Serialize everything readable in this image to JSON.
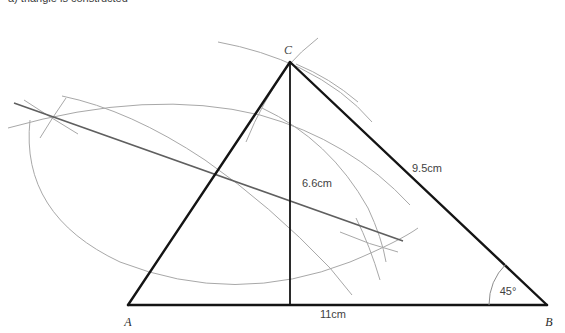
{
  "caption": {
    "text": "a) triangle is constructed"
  },
  "figure": {
    "colors": {
      "triangle_stroke": "#111111",
      "construction_arc": "#9a9a9a",
      "bisector_line": "#5a5a5a",
      "label_text": "#3f3f3f",
      "background": "#ffffff"
    },
    "vertices": [
      {
        "name": "A",
        "label": "A",
        "x": 128,
        "y": 305
      },
      {
        "name": "B",
        "label": "B",
        "x": 547,
        "y": 305
      },
      {
        "name": "C",
        "label": "C",
        "x": 290,
        "y": 62
      }
    ],
    "measurements": [
      {
        "name": "base",
        "label": "11cm",
        "x": 333,
        "y": 315
      },
      {
        "name": "side-cb",
        "label": "9.5cm",
        "x": 412,
        "y": 172
      },
      {
        "name": "altitude",
        "label": "6.6cm",
        "x": 302,
        "y": 187
      },
      {
        "name": "angle-b",
        "label": "45°",
        "x": 508,
        "y": 291
      }
    ],
    "altitude": {
      "foot_x": 290,
      "foot_y": 305
    },
    "angle_arc": {
      "center_x": 547,
      "center_y": 305,
      "radius": 58,
      "degrees": 45
    }
  }
}
